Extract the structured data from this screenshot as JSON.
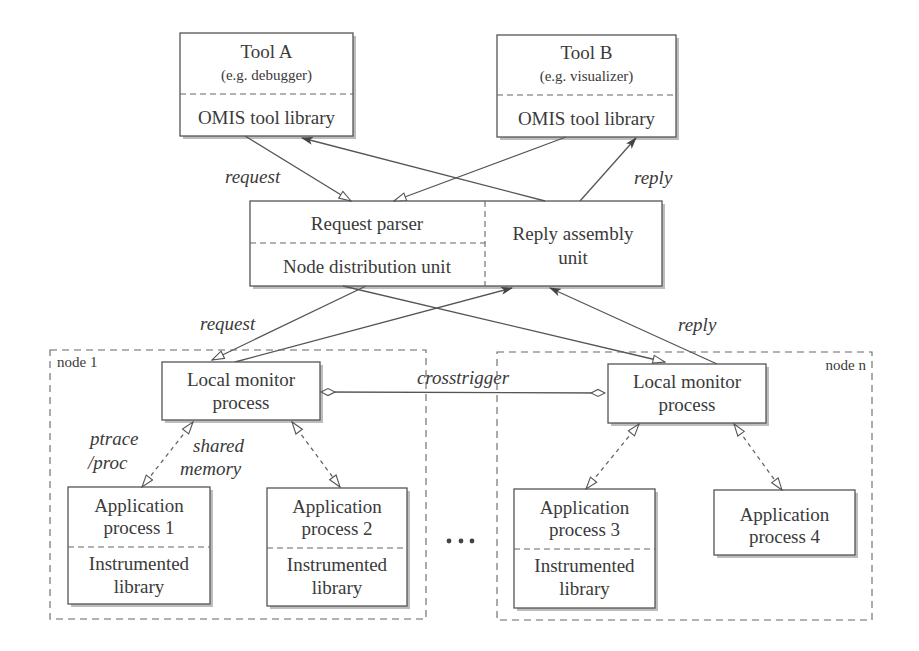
{
  "diagram": {
    "tools": [
      {
        "title": "Tool A",
        "subtitle": "(e.g. debugger)",
        "library": "OMIS tool library"
      },
      {
        "title": "Tool B",
        "subtitle": "(e.g. visualizer)",
        "library": "OMIS tool library"
      }
    ],
    "central": {
      "request_parser": "Request parser",
      "node_distribution": "Node distribution unit",
      "reply_assembly_line1": "Reply assembly",
      "reply_assembly_line2": "unit"
    },
    "edge_labels": {
      "request_top": "request",
      "reply_top": "reply",
      "request_bottom": "request",
      "reply_bottom": "reply",
      "crosstrigger": "crosstrigger",
      "ptrace_line1": "ptrace",
      "ptrace_line2": "/proc",
      "shared_line1": "shared",
      "shared_line2": "memory"
    },
    "nodes": [
      {
        "label": "node 1",
        "monitor_line1": "Local monitor",
        "monitor_line2": "process",
        "apps": [
          {
            "line1": "Application",
            "line2": "process 1",
            "lib1": "Instrumented",
            "lib2": "library"
          },
          {
            "line1": "Application",
            "line2": "process 2",
            "lib1": "Instrumented",
            "lib2": "library"
          }
        ]
      },
      {
        "label": "node n",
        "monitor_line1": "Local monitor",
        "monitor_line2": "process",
        "apps": [
          {
            "line1": "Application",
            "line2": "process 3",
            "lib1": "Instrumented",
            "lib2": "library"
          },
          {
            "line1": "Application",
            "line2": "process 4"
          }
        ]
      }
    ],
    "ellipsis": "..."
  }
}
